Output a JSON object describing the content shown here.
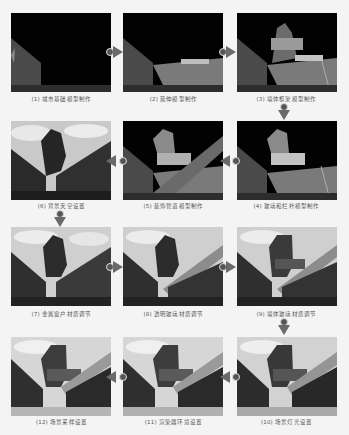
{
  "figure": {
    "steps": [
      {
        "index": 1,
        "caption": "(1) 城市基础模型制作",
        "scene": "dark"
      },
      {
        "index": 2,
        "caption": "(2) 延伸模型制作",
        "scene": "dark"
      },
      {
        "index": 3,
        "caption": "(3) 墙体框架模型制作",
        "scene": "dark"
      },
      {
        "index": 4,
        "caption": "(4) 玻璃和栏杆模型制作",
        "scene": "dark"
      },
      {
        "index": 5,
        "caption": "(5) 装饰管道模型制作",
        "scene": "dark"
      },
      {
        "index": 6,
        "caption": "(6) 背景天空设置",
        "scene": "sky"
      },
      {
        "index": 7,
        "caption": "(7) 金属窗户材质调节",
        "scene": "sky"
      },
      {
        "index": 8,
        "caption": "(8) 透明玻璃材质调节",
        "scene": "sky"
      },
      {
        "index": 9,
        "caption": "(9) 墙体玻璃材质调节",
        "scene": "sky"
      },
      {
        "index": 10,
        "caption": "(10) 场景灯光设置",
        "scene": "lit"
      },
      {
        "index": 11,
        "caption": "(11) 渲染器环境设置",
        "scene": "lit"
      },
      {
        "index": 12,
        "caption": "(12) 场景采样设置",
        "scene": "lit"
      }
    ],
    "flow": "serpentine: row1 left→right, down, row2 right→left, down, row3 left→right, down, row4 right→left",
    "colors": {
      "background": "#f4f4f4",
      "arrow": "#666666",
      "caption": "#555555"
    }
  }
}
